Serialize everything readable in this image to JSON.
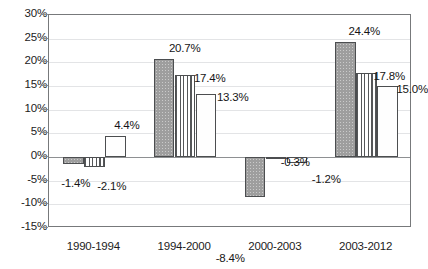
{
  "chart_data": {
    "type": "bar",
    "title": "",
    "subtitle": "",
    "xlabel": "",
    "ylabel": "",
    "categories": [
      "1990-1994",
      "1994-2000",
      "2000-2003",
      "2003-2012"
    ],
    "series": [
      {
        "name": "series-1",
        "fill": "solid-gray",
        "values": [
          -1.4,
          20.7,
          -8.4,
          24.4
        ]
      },
      {
        "name": "series-2",
        "fill": "vertical-hatch",
        "values": [
          -2.1,
          17.4,
          -0.3,
          17.8
        ]
      },
      {
        "name": "series-3",
        "fill": "white",
        "values": [
          4.4,
          13.3,
          -1.2,
          15.0
        ]
      }
    ],
    "data_labels": [
      [
        "-1.4%",
        "20.7%",
        "-8.4%",
        "24.4%"
      ],
      [
        "-2.1%",
        "17.4%",
        "-0.3%",
        "17.8%"
      ],
      [
        "4.4%",
        "13.3%",
        "-1.2%",
        "15.0%"
      ]
    ],
    "ylim": [
      -15,
      30
    ],
    "ytick_step": 5,
    "ytick_labels": [
      "30%",
      "25%",
      "20%",
      "15%",
      "10%",
      "5%",
      "0%",
      "-5%",
      "-10%",
      "-15%"
    ],
    "ytick_values": [
      30,
      25,
      20,
      15,
      10,
      5,
      0,
      -5,
      -10,
      -15
    ],
    "grid": true,
    "legend": "none",
    "colors": {
      "series_1": "#9e9e9e",
      "series_2": "#ffffff",
      "series_3": "#ffffff",
      "bar_outline": "#4c4e50",
      "gridline": "#e3e4e6",
      "zero_line": "#8e9092",
      "axis": "#77797b",
      "text": "#1a1a1a",
      "background": "#ffffff"
    }
  }
}
